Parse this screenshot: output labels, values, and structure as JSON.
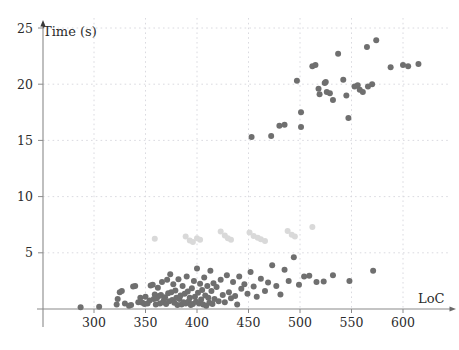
{
  "chart_data": {
    "type": "scatter",
    "title": "",
    "xlabel": "LoC",
    "ylabel": "Time (s)",
    "xlim": [
      255,
      640
    ],
    "ylim": [
      0,
      25.6
    ],
    "grid": true,
    "legend": "none",
    "x_ticks": [
      300,
      350,
      400,
      450,
      500,
      550,
      600
    ],
    "y_ticks": [
      5,
      10,
      15,
      20,
      25
    ],
    "x_tick_labels": [
      "300",
      "350",
      "400",
      "450",
      "500",
      "550",
      "600"
    ],
    "y_tick_labels": [
      "5",
      "10",
      "15",
      "20",
      "25"
    ],
    "colors": {
      "series_dark": "#6f6f6f",
      "series_light": "#d9d9d9",
      "axis": "#8a8a8a",
      "grid": "#d6d6dd",
      "text": "#2b2b2b",
      "background": "#ffffff"
    },
    "marker": {
      "shape": "circle",
      "radius_px": 3.0
    },
    "series": [
      {
        "name": "low-time-group",
        "color": "#6f6f6f",
        "points": [
          [
            287,
            0.15
          ],
          [
            305,
            0.2
          ],
          [
            322,
            0.4
          ],
          [
            323,
            0.9
          ],
          [
            325,
            1.5
          ],
          [
            327,
            1.6
          ],
          [
            330,
            0.5
          ],
          [
            334,
            0.3
          ],
          [
            336,
            0.35
          ],
          [
            338,
            2.0
          ],
          [
            340,
            2.05
          ],
          [
            343,
            0.6
          ],
          [
            345,
            1.0
          ],
          [
            347,
            0.55
          ],
          [
            349,
            0.45
          ],
          [
            350,
            1.1
          ],
          [
            352,
            0.5
          ],
          [
            354,
            0.75
          ],
          [
            355,
            2.1
          ],
          [
            357,
            2.15
          ],
          [
            358,
            0.9
          ],
          [
            359,
            1.3
          ],
          [
            360,
            0.4
          ],
          [
            361,
            0.95
          ],
          [
            362,
            1.9
          ],
          [
            363,
            1.15
          ],
          [
            364,
            0.5
          ],
          [
            365,
            1.25
          ],
          [
            366,
            2.4
          ],
          [
            367,
            0.6
          ],
          [
            368,
            0.85
          ],
          [
            369,
            1.05
          ],
          [
            370,
            0.45
          ],
          [
            371,
            2.6
          ],
          [
            372,
            1.4
          ],
          [
            373,
            0.7
          ],
          [
            374,
            3.1
          ],
          [
            375,
            1.5
          ],
          [
            376,
            0.8
          ],
          [
            377,
            2.2
          ],
          [
            378,
            0.55
          ],
          [
            379,
            1.65
          ],
          [
            380,
            1.0
          ],
          [
            381,
            0.35
          ],
          [
            382,
            2.65
          ],
          [
            383,
            0.9
          ],
          [
            384,
            1.2
          ],
          [
            385,
            0.4
          ],
          [
            386,
            2.05
          ],
          [
            387,
            0.6
          ],
          [
            388,
            1.35
          ],
          [
            389,
            0.5
          ],
          [
            390,
            2.9
          ],
          [
            391,
            1.55
          ],
          [
            392,
            0.7
          ],
          [
            393,
            1.0
          ],
          [
            394,
            0.35
          ],
          [
            395,
            1.85
          ],
          [
            396,
            0.45
          ],
          [
            397,
            2.5
          ],
          [
            398,
            1.1
          ],
          [
            399,
            0.65
          ],
          [
            400,
            3.6
          ],
          [
            401,
            1.45
          ],
          [
            402,
            0.5
          ],
          [
            403,
            2.25
          ],
          [
            404,
            0.85
          ],
          [
            405,
            1.7
          ],
          [
            406,
            0.4
          ],
          [
            407,
            2.8
          ],
          [
            408,
            1.2
          ],
          [
            409,
            0.3
          ],
          [
            410,
            2.05
          ],
          [
            411,
            1.0
          ],
          [
            412,
            0.55
          ],
          [
            413,
            3.4
          ],
          [
            414,
            1.6
          ],
          [
            415,
            0.45
          ],
          [
            416,
            2.3
          ],
          [
            417,
            0.9
          ],
          [
            419,
            1.95
          ],
          [
            421,
            0.7
          ],
          [
            423,
            2.6
          ],
          [
            425,
            1.25
          ],
          [
            427,
            0.6
          ],
          [
            429,
            3.0
          ],
          [
            431,
            1.5
          ],
          [
            433,
            0.95
          ],
          [
            435,
            2.4
          ],
          [
            437,
            1.15
          ],
          [
            439,
            0.4
          ],
          [
            441,
            2.9
          ],
          [
            443,
            1.8
          ],
          [
            446,
            2.2
          ],
          [
            449,
            1.35
          ],
          [
            452,
            3.3
          ],
          [
            455,
            2.0
          ],
          [
            458,
            1.1
          ],
          [
            462,
            2.7
          ],
          [
            466,
            1.6
          ],
          [
            469,
            2.35
          ],
          [
            473,
            3.9
          ],
          [
            477,
            2.05
          ],
          [
            481,
            1.3
          ],
          [
            485,
            3.5
          ],
          [
            489,
            2.5
          ],
          [
            494,
            4.6
          ],
          [
            499,
            2.15
          ],
          [
            504,
            2.9
          ],
          [
            509,
            2.95
          ],
          [
            516,
            2.4
          ],
          [
            523,
            2.45
          ],
          [
            532,
            3.0
          ],
          [
            548,
            2.5
          ],
          [
            571,
            3.4
          ]
        ]
      },
      {
        "name": "mid-time-group",
        "color": "#d9d9d9",
        "points": [
          [
            359,
            6.25
          ],
          [
            389,
            6.45
          ],
          [
            393,
            6.1
          ],
          [
            396,
            5.95
          ],
          [
            400,
            6.3
          ],
          [
            403,
            6.15
          ],
          [
            423,
            6.9
          ],
          [
            427,
            6.55
          ],
          [
            430,
            6.3
          ],
          [
            433,
            6.15
          ],
          [
            451,
            6.8
          ],
          [
            455,
            6.5
          ],
          [
            459,
            6.35
          ],
          [
            462,
            6.2
          ],
          [
            466,
            6.05
          ],
          [
            488,
            6.95
          ],
          [
            492,
            6.6
          ],
          [
            495,
            6.45
          ],
          [
            512,
            7.3
          ]
        ]
      },
      {
        "name": "high-time-group",
        "color": "#6f6f6f",
        "points": [
          [
            453,
            15.3
          ],
          [
            472,
            15.4
          ],
          [
            480,
            16.3
          ],
          [
            485,
            16.4
          ],
          [
            497,
            20.3
          ],
          [
            501,
            17.5
          ],
          [
            501,
            16.2
          ],
          [
            512,
            21.6
          ],
          [
            515,
            21.7
          ],
          [
            518,
            19.6
          ],
          [
            519,
            19.1
          ],
          [
            524,
            20.1
          ],
          [
            525,
            20.2
          ],
          [
            526,
            19.3
          ],
          [
            529,
            19.2
          ],
          [
            532,
            18.6
          ],
          [
            537,
            22.7
          ],
          [
            542,
            20.4
          ],
          [
            545,
            19.0
          ],
          [
            547,
            17.0
          ],
          [
            553,
            19.8
          ],
          [
            556,
            19.9
          ],
          [
            558,
            19.5
          ],
          [
            561,
            19.3
          ],
          [
            565,
            23.3
          ],
          [
            566,
            19.8
          ],
          [
            570,
            20.0
          ],
          [
            574,
            23.9
          ],
          [
            588,
            21.5
          ],
          [
            600,
            21.7
          ],
          [
            605,
            21.6
          ],
          [
            615,
            21.8
          ]
        ]
      }
    ]
  },
  "axes": {
    "y_axis_title": "Time (s)",
    "x_axis_title": "LoC"
  }
}
